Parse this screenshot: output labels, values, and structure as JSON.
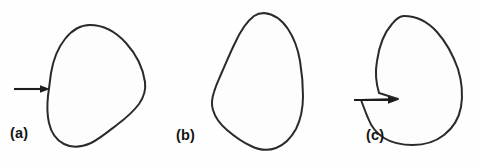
{
  "figure": {
    "type": "line-drawing",
    "background_color": "#fefefe",
    "stroke_color": "#2a2a2a",
    "width": 478,
    "height": 165,
    "panel_count": 3
  },
  "panels": [
    {
      "id": "a",
      "label": "(a)",
      "shape_name": "convex-blob",
      "shape_description": "smooth closed convex outline, rounded egg-like blob",
      "has_arrow": true,
      "arrow_name": "pointer-arrow-a",
      "arrow_target_description": "smooth boundary point on left side",
      "arrow_direction": "right",
      "arrow_tip_x": 50,
      "arrow_tip_y": 89,
      "arrow_tail_x": 14,
      "arrow_tail_y": 89,
      "label_x": 10,
      "label_y": 126
    },
    {
      "id": "b",
      "label": "(b)",
      "shape_name": "teardrop-blob",
      "shape_description": "closed pear / teardrop outline, narrow at top, broad at bottom",
      "has_arrow": false,
      "arrow_name": "",
      "arrow_target_description": "",
      "arrow_direction": "",
      "arrow_tip_x": 0,
      "arrow_tip_y": 0,
      "arrow_tail_x": 0,
      "arrow_tail_y": 0,
      "label_x": 176,
      "label_y": 128
    },
    {
      "id": "c",
      "label": "(c)",
      "shape_name": "notched-blob",
      "shape_description": "closed outline with a sharp concave notch on the left side",
      "has_arrow": true,
      "arrow_name": "pointer-arrow-c",
      "arrow_target_description": "sharp concave vertex (notch) on left boundary",
      "arrow_direction": "right",
      "arrow_tip_x": 398,
      "arrow_tip_y": 100,
      "arrow_tail_x": 354,
      "arrow_tail_y": 100,
      "label_x": 366,
      "label_y": 128
    }
  ],
  "colors": {
    "stroke": "#2a2a2a",
    "arrow": "#1c1c1c",
    "label_text": "#141414",
    "background": "#fefefe",
    "shape_fill": "#fdfdfd"
  }
}
